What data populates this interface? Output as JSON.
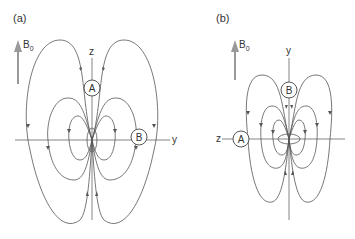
{
  "panels": [
    {
      "label": "(a)",
      "field_label": "B",
      "field_sub": "0",
      "vertical_axis": "z",
      "horizontal_axis": "y",
      "point_on_vertical": "A",
      "point_on_horizontal": "B"
    },
    {
      "label": "(b)",
      "field_label": "B",
      "field_sub": "0",
      "vertical_axis": "y",
      "horizontal_axis": "z",
      "point_on_vertical": "B",
      "point_on_horizontal": "A"
    }
  ],
  "colors": {
    "field_arrow": "#999999",
    "lines": "#555555",
    "text": "#333333"
  }
}
